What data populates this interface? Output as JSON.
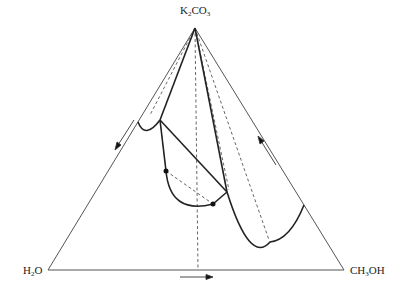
{
  "diagram": {
    "type": "ternary-phase-diagram",
    "vertices": {
      "top": {
        "pre": "K",
        "sub1": "2",
        "mid": "CO",
        "sub2": "3"
      },
      "left": {
        "pre": "H",
        "sub1": "2",
        "mid": "O",
        "sub2": ""
      },
      "right": {
        "pre": "CH",
        "sub1": "3",
        "mid": "OH",
        "sub2": ""
      }
    },
    "arrows": [
      {
        "edge": "left",
        "direction": "down-left"
      },
      {
        "edge": "right",
        "direction": "up-left"
      },
      {
        "edge": "bottom",
        "direction": "right"
      }
    ],
    "colors": {
      "outline": "#555555",
      "curve": "#222222",
      "dashed": "#555555"
    }
  }
}
